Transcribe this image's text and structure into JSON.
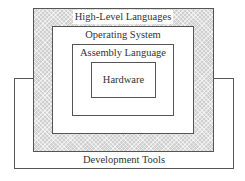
{
  "diagram": {
    "type": "nested-layers",
    "layers": [
      {
        "id": "hardware",
        "label": "Hardware"
      },
      {
        "id": "assembly",
        "label": "Assembly Language"
      },
      {
        "id": "os",
        "label": "Operating System"
      },
      {
        "id": "hll",
        "label": "High-Level Languages"
      },
      {
        "id": "dev_tools",
        "label": "Development Tools"
      }
    ],
    "colors": {
      "border": "#555555",
      "hatch_fill": "#cfcfcf",
      "background": "#ffffff",
      "text": "#333333"
    }
  }
}
